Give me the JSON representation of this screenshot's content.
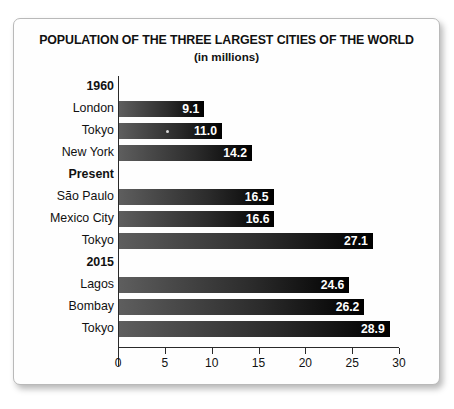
{
  "chart_data": {
    "type": "bar",
    "orientation": "horizontal",
    "title": "POPULATION OF THE THREE LARGEST CITIES OF THE WORLD",
    "subtitle": "(in millions)",
    "xlabel": "",
    "ylabel": "",
    "xlim": [
      0,
      30
    ],
    "xticks": [
      0,
      5,
      10,
      15,
      20,
      25,
      30
    ],
    "xtick_labels": [
      "0",
      "5",
      "10",
      "15",
      "20",
      "25",
      "30"
    ],
    "grid": false,
    "legend": false,
    "bar_color_start": "#5e5e5e",
    "bar_color_end": "#000000",
    "value_label_color": "#ffffff",
    "groups": [
      {
        "heading": "1960",
        "rows": [
          {
            "label": "London",
            "value": 9.1,
            "value_label": "9.1"
          },
          {
            "label": "Tokyo",
            "value": 11.0,
            "value_label": "11.0"
          },
          {
            "label": "New York",
            "value": 14.2,
            "value_label": "14.2"
          }
        ]
      },
      {
        "heading": "Present",
        "rows": [
          {
            "label": "São Paulo",
            "value": 16.5,
            "value_label": "16.5"
          },
          {
            "label": "Mexico City",
            "value": 16.6,
            "value_label": "16.6"
          },
          {
            "label": "Tokyo",
            "value": 27.1,
            "value_label": "27.1"
          }
        ]
      },
      {
        "heading": "2015",
        "rows": [
          {
            "label": "Lagos",
            "value": 24.6,
            "value_label": "24.6"
          },
          {
            "label": "Bombay",
            "value": 26.2,
            "value_label": "26.2"
          },
          {
            "label": "Tokyo",
            "value": 28.9,
            "value_label": "28.9"
          }
        ]
      }
    ],
    "categories": [
      "London",
      "Tokyo",
      "New York",
      "São Paulo",
      "Mexico City",
      "Tokyo",
      "Lagos",
      "Bombay",
      "Tokyo"
    ],
    "values": [
      9.1,
      11.0,
      14.2,
      16.5,
      16.6,
      27.1,
      24.6,
      26.2,
      28.9
    ]
  }
}
